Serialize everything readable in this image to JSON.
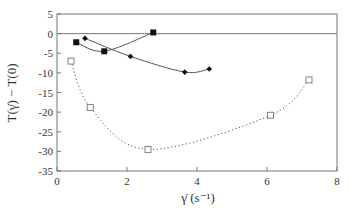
{
  "chart_data": {
    "type": "line",
    "title": "",
    "xlabel": "γ̇ (s⁻¹)",
    "ylabel": "T(γ̇) − T(0)",
    "xlim": [
      0,
      8
    ],
    "ylim": [
      -35,
      5
    ],
    "xticks": [
      0,
      2,
      4,
      6,
      8
    ],
    "yticks": [
      5,
      0,
      -5,
      -10,
      -15,
      -20,
      -25,
      -30,
      -35
    ],
    "grid": false,
    "legend": null,
    "reference_line": {
      "y": 0
    },
    "series": [
      {
        "name": "filled-squares",
        "marker": "filled-square",
        "line": "solid",
        "points": [
          [
            0.55,
            -2.2
          ],
          [
            1.35,
            -4.5
          ],
          [
            2.75,
            0.3
          ]
        ]
      },
      {
        "name": "filled-diamonds",
        "marker": "filled-diamond",
        "line": "solid",
        "points": [
          [
            0.8,
            -1.2
          ],
          [
            2.1,
            -5.8
          ],
          [
            3.65,
            -9.8
          ],
          [
            4.35,
            -9.0
          ]
        ]
      },
      {
        "name": "open-squares",
        "marker": "open-square",
        "line": "dotted",
        "points": [
          [
            0.4,
            -7.0
          ],
          [
            0.95,
            -18.8
          ],
          [
            2.6,
            -29.5
          ],
          [
            6.1,
            -20.8
          ],
          [
            7.2,
            -11.8
          ]
        ]
      }
    ]
  }
}
